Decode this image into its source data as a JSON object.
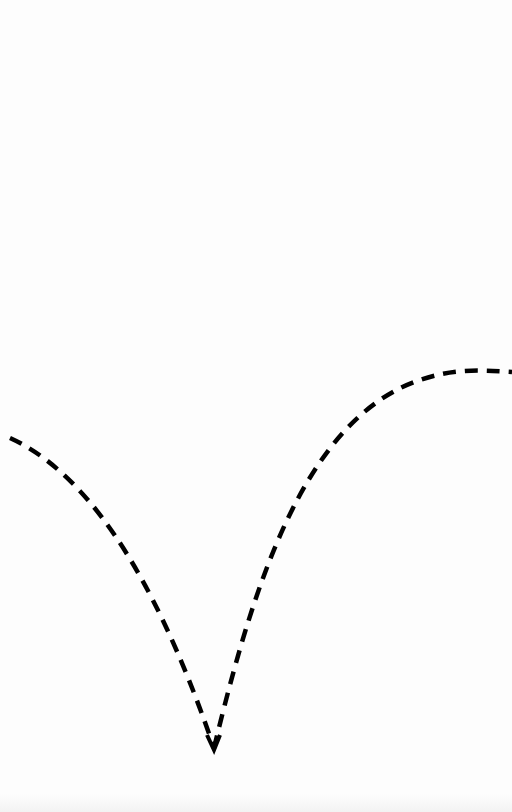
{
  "diagram": {
    "stroke_color": "#000000",
    "background_color": "#fdfdfd",
    "curve": {
      "style": "dashed",
      "left_branch": {
        "start": [
          10,
          438
        ],
        "end": [
          214,
          748
        ],
        "shape": "concave, descending"
      },
      "cusp": [
        214,
        748
      ],
      "right_branch": {
        "start": [
          214,
          748
        ],
        "peak": [
          478,
          370
        ],
        "end": [
          512,
          372
        ],
        "shape": "concave, ascending to maximum"
      }
    }
  }
}
